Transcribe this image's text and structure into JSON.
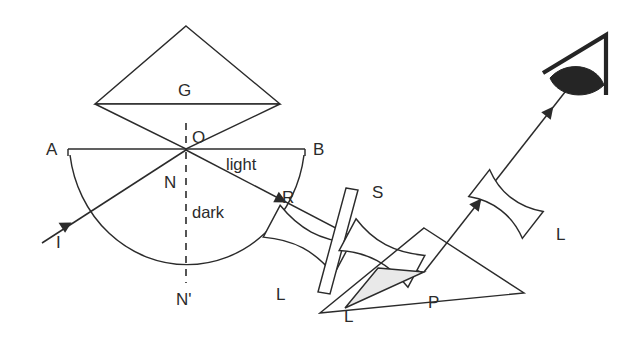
{
  "diagram": {
    "background_color": "#ffffff",
    "line_color": "#2b2b2b",
    "shade_color": "#e9e9e9",
    "labels": {
      "prism_top": "G",
      "point_a": "A",
      "point_b": "B",
      "point_o": "O",
      "point_n": "N",
      "point_n_prime": "N'",
      "incident_ray": "I",
      "refracted_ray": "R",
      "region_light": "light",
      "region_dark": "dark",
      "lens_left": "L",
      "lens_middle": "L",
      "slit": "S",
      "prism_bottom": "P",
      "lens_right": "L"
    },
    "components": [
      {
        "name": "glass-prism-G",
        "label": "G",
        "kind": "prism"
      },
      {
        "name": "semicircular-cell",
        "label": "",
        "kind": "half-disc"
      },
      {
        "name": "collimating-lens-L1",
        "label": "L",
        "kind": "lens"
      },
      {
        "name": "slit-S",
        "label": "S",
        "kind": "slit"
      },
      {
        "name": "lens-L2",
        "label": "L",
        "kind": "lens"
      },
      {
        "name": "reflecting-prism-P",
        "label": "P",
        "kind": "prism"
      },
      {
        "name": "eyepiece-lens-L3",
        "label": "L",
        "kind": "lens"
      },
      {
        "name": "observer-eye",
        "label": "",
        "kind": "eye"
      }
    ],
    "rays": [
      {
        "name": "incident-ray-I",
        "label": "I"
      },
      {
        "name": "refracted-ray-R",
        "label": "R"
      },
      {
        "name": "ray-to-prism-P",
        "label": ""
      },
      {
        "name": "ray-to-eye",
        "label": ""
      }
    ],
    "axes": {
      "boundary_line": "A-B",
      "normal_line": "N-N'"
    }
  }
}
